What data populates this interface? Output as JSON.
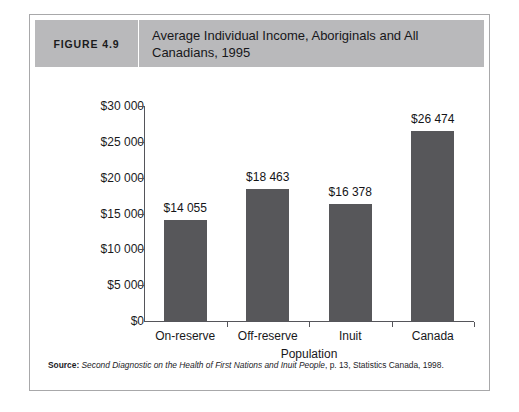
{
  "figure": {
    "number_label": "FIGURE 4.9",
    "title": "Average Individual Income, Aboriginals and All Canadians, 1995"
  },
  "source": {
    "label": "Source:",
    "title": "Second Diagnostic on the Health of First Nations and Inuit People",
    "citation": ", p. 13, Statistics Canada, 1998."
  },
  "colors": {
    "bar_fill": "#57575a",
    "header_band": "#b9b9bb",
    "axis_line": "#55555a",
    "frame_border": "#a8a8aa"
  },
  "chart_data": {
    "type": "bar",
    "title": "Average Individual Income, Aboriginals and All Canadians, 1995",
    "xlabel": "Population",
    "ylabel": "",
    "categories": [
      "On-reserve",
      "Off-reserve",
      "Inuit",
      "Canada"
    ],
    "values": [
      14055,
      18463,
      16378,
      26474
    ],
    "value_labels": [
      "$14 055",
      "$18 463",
      "$16 378",
      "$26 474"
    ],
    "ylim": [
      0,
      30000
    ],
    "ytick_values": [
      0,
      5000,
      10000,
      15000,
      20000,
      25000,
      30000
    ],
    "ytick_labels": [
      "$0",
      "$5 000",
      "$10 000",
      "$15 000",
      "$20 000",
      "$25 000",
      "$30 000"
    ],
    "grid": false,
    "legend": false,
    "series": [
      {
        "name": "Average individual income, 1995",
        "values": [
          14055,
          18463,
          16378,
          26474
        ]
      }
    ]
  }
}
